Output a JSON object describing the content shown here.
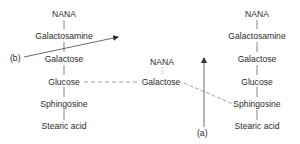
{
  "diagram": {
    "left_structure": {
      "nodes": [
        "NANA",
        "Galactosamine",
        "Galactose",
        "Glucose",
        "Sphingosine",
        "Stearic acid"
      ]
    },
    "middle_fragment": {
      "nodes": [
        "NANA",
        "Galactose"
      ]
    },
    "right_structure": {
      "nodes": [
        "NANA",
        "Galactosamine",
        "Galactose",
        "Glucose",
        "Sphingosine",
        "Stearic acid"
      ]
    },
    "labels": {
      "a": "(a)",
      "b": "(b)"
    },
    "colors": {
      "text": "#2b2b2b",
      "line": "#555555",
      "dashed": "#8a8a8a"
    }
  }
}
